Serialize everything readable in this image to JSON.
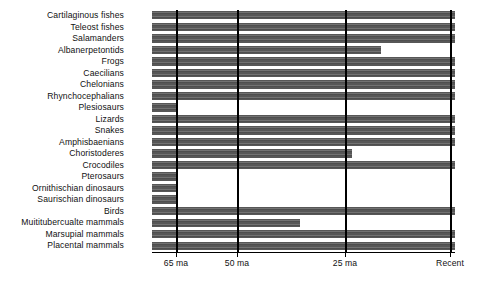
{
  "chart_data": {
    "type": "bar",
    "orientation": "horizontal",
    "title": "",
    "xlabel": "",
    "ylabel": "",
    "x_unit": "ma",
    "x_axis_direction": "past-to-present",
    "xlim": [
      70,
      -2
    ],
    "grid": false,
    "legend_position": "none",
    "axis_ticks": [
      {
        "label": "65 ma",
        "value": 65,
        "x_px": 176
      },
      {
        "label": "50 ma",
        "value": 50,
        "x_px": 237
      },
      {
        "label": "25 ma",
        "value": 25,
        "x_px": 345
      },
      {
        "label": "Recent",
        "value": 0,
        "x_px": 450
      }
    ],
    "bar_start_value": 70,
    "categories": [
      "Cartilaginous fishes",
      "Teleost fishes",
      "Salamanders",
      "Albanerpetontids",
      "Frogs",
      "Caecilians",
      "Chelonians",
      "Rhynchocephalians",
      "Plesiosaurs",
      "Lizards",
      "Snakes",
      "Amphisbaenians",
      "Choristoderes",
      "Crocodiles",
      "Pterosaurs",
      "Ornithischian dinosaurs",
      "Saurischian dinosaurs",
      "Birds",
      "Muititubercualte mammals",
      "Marsupial mammals",
      "Placental mammals"
    ],
    "series": [
      {
        "name": "Stratigraphic range",
        "values": [
          0,
          0,
          0,
          18,
          0,
          0,
          0,
          0,
          65,
          0,
          0,
          0,
          23,
          0,
          65,
          65,
          65,
          0,
          37,
          0,
          0
        ]
      }
    ],
    "bars": [
      {
        "label": "Cartilaginous fishes",
        "end_value": 0,
        "end_px": 455,
        "extinct": false
      },
      {
        "label": "Teleost fishes",
        "end_value": 0,
        "end_px": 455,
        "extinct": false
      },
      {
        "label": "Salamanders",
        "end_value": 0,
        "end_px": 455,
        "extinct": false
      },
      {
        "label": "Albanerpetontids",
        "end_value": 18,
        "end_px": 381,
        "extinct": true
      },
      {
        "label": "Frogs",
        "end_value": 0,
        "end_px": 455,
        "extinct": false
      },
      {
        "label": "Caecilians",
        "end_value": 0,
        "end_px": 455,
        "extinct": false
      },
      {
        "label": "Chelonians",
        "end_value": 0,
        "end_px": 455,
        "extinct": false
      },
      {
        "label": "Rhynchocephalians",
        "end_value": 0,
        "end_px": 455,
        "extinct": false
      },
      {
        "label": "Plesiosaurs",
        "end_value": 65,
        "end_px": 177,
        "extinct": true
      },
      {
        "label": "Lizards",
        "end_value": 0,
        "end_px": 455,
        "extinct": false
      },
      {
        "label": "Snakes",
        "end_value": 0,
        "end_px": 455,
        "extinct": false
      },
      {
        "label": "Amphisbaenians",
        "end_value": 0,
        "end_px": 455,
        "extinct": false
      },
      {
        "label": "Choristoderes",
        "end_value": 23,
        "end_px": 352,
        "extinct": true
      },
      {
        "label": "Crocodiles",
        "end_value": 0,
        "end_px": 455,
        "extinct": false
      },
      {
        "label": "Pterosaurs",
        "end_value": 65,
        "end_px": 177,
        "extinct": true
      },
      {
        "label": "Ornithischian dinosaurs",
        "end_value": 65,
        "end_px": 177,
        "extinct": true
      },
      {
        "label": "Saurischian dinosaurs",
        "end_value": 65,
        "end_px": 177,
        "extinct": true
      },
      {
        "label": "Birds",
        "end_value": 0,
        "end_px": 455,
        "extinct": false
      },
      {
        "label": "Muititubercualte mammals",
        "end_value": 37,
        "end_px": 300,
        "extinct": true
      },
      {
        "label": "Marsupial mammals",
        "end_value": 0,
        "end_px": 455,
        "extinct": false
      },
      {
        "label": "Placental mammals",
        "end_value": 0,
        "end_px": 455,
        "extinct": false
      }
    ],
    "colors": {
      "bar": "#575757",
      "rule": "#000000",
      "text": "#111111",
      "background": "#ffffff"
    }
  }
}
